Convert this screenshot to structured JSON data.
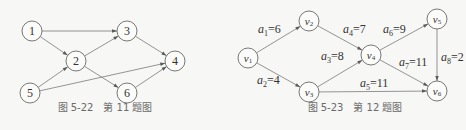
{
  "figures": [
    {
      "id": "fig-5-22",
      "caption": "图 5-22　第 11 题图",
      "nodes": [
        {
          "id": "1",
          "label": "1",
          "x": 32,
          "y": 31
        },
        {
          "id": "2",
          "label": "2",
          "x": 76,
          "y": 61
        },
        {
          "id": "3",
          "label": "3",
          "x": 127,
          "y": 31
        },
        {
          "id": "4",
          "label": "4",
          "x": 175,
          "y": 61
        },
        {
          "id": "5",
          "label": "5",
          "x": 30,
          "y": 93
        },
        {
          "id": "6",
          "label": "6",
          "x": 127,
          "y": 93
        }
      ],
      "edges": [
        {
          "from": "1",
          "to": "3"
        },
        {
          "from": "1",
          "to": "2"
        },
        {
          "from": "2",
          "to": "3"
        },
        {
          "from": "2",
          "to": "6"
        },
        {
          "from": "3",
          "to": "4"
        },
        {
          "from": "5",
          "to": "2"
        },
        {
          "from": "5",
          "to": "4"
        },
        {
          "from": "6",
          "to": "4"
        }
      ]
    },
    {
      "id": "fig-5-23",
      "caption": "图 5-23　第 12 题图",
      "nodes": [
        {
          "id": "v1",
          "label": "v",
          "sub": "1",
          "x": 248,
          "y": 58
        },
        {
          "id": "v2",
          "label": "v",
          "sub": "2",
          "x": 309,
          "y": 21
        },
        {
          "id": "v3",
          "label": "v",
          "sub": "3",
          "x": 309,
          "y": 92
        },
        {
          "id": "v4",
          "label": "v",
          "sub": "4",
          "x": 371,
          "y": 55
        },
        {
          "id": "v5",
          "label": "v",
          "sub": "5",
          "x": 437,
          "y": 19
        },
        {
          "id": "v6",
          "label": "v",
          "sub": "6",
          "x": 437,
          "y": 91
        }
      ],
      "edges": [
        {
          "from": "v1",
          "to": "v2",
          "name": "a",
          "sub": "1",
          "weight": "6",
          "lx": 258,
          "ly": 33
        },
        {
          "from": "v1",
          "to": "v3",
          "name": "a",
          "sub": "2",
          "weight": "4",
          "lx": 257,
          "ly": 84
        },
        {
          "from": "v3",
          "to": "v4",
          "name": "a",
          "sub": "3",
          "weight": "8",
          "lx": 321,
          "ly": 60
        },
        {
          "from": "v2",
          "to": "v4",
          "name": "a",
          "sub": "4",
          "weight": "7",
          "lx": 343,
          "ly": 33
        },
        {
          "from": "v3",
          "to": "v6",
          "name": "a",
          "sub": "5",
          "weight": "11",
          "lx": 360,
          "ly": 87
        },
        {
          "from": "v4",
          "to": "v5",
          "name": "a",
          "sub": "6",
          "weight": "9",
          "lx": 383,
          "ly": 33
        },
        {
          "from": "v4",
          "to": "v6",
          "name": "a",
          "sub": "7",
          "weight": "11",
          "lx": 399,
          "ly": 66
        },
        {
          "from": "v5",
          "to": "v6",
          "name": "a",
          "sub": "8",
          "weight": "2",
          "lx": 441,
          "ly": 61
        }
      ]
    }
  ]
}
